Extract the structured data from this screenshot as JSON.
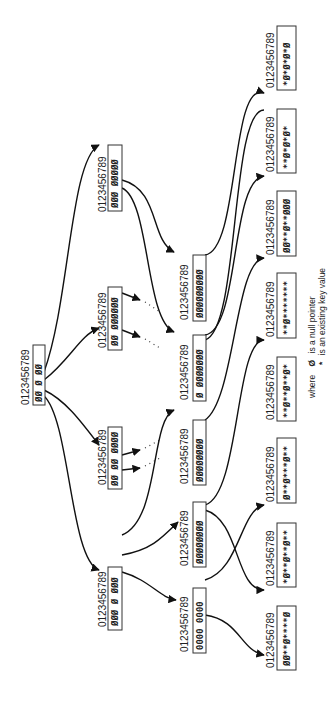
{
  "diagram": {
    "orientation": "rotated -90deg (text reads bottom-to-top)",
    "index_label": "0123456789",
    "root": {
      "label": "0123456789",
      "contents": "ØØ Ø ØØ"
    },
    "level1": [
      {
        "label": "0123456789",
        "contents": "ØØØ ØØØØØ"
      },
      {
        "label": "0123456789",
        "contents": "ØØ ØØØØØØ"
      },
      {
        "label": "0123456789",
        "contents": "ØØ ØØ ØØØØ"
      },
      {
        "label": "0123456789",
        "contents": "ØØØ Ø ØØØ"
      }
    ],
    "level2": [
      {
        "label": "0123456789",
        "contents": "ØØØØØØØØØ"
      },
      {
        "label": "0123456789",
        "contents": "Ø ØØØØØØØ"
      },
      {
        "label": "0123456789",
        "contents": "ØØØØØØØØ"
      },
      {
        "label": "0123456789",
        "contents": "ØØØØØØØØ"
      },
      {
        "label": "0123456789",
        "contents": "0000 0000"
      }
    ],
    "leaves": [
      {
        "label": "0123456789",
        "contents": "*Ø*Ø*Ø*Ø"
      },
      {
        "label": "0123456789",
        "contents": "**Ø*Ø*Ø*"
      },
      {
        "label": "0123456789",
        "contents": "ØØ**Ø**ØØØ"
      },
      {
        "label": "0123456789",
        "contents": "**Ø*******"
      },
      {
        "label": "0123456789",
        "contents": "**Ø**Ø**Ø*"
      },
      {
        "label": "0123456789",
        "contents": "Ø**Ø***Ø**"
      },
      {
        "label": "0123456789",
        "contents": "*Ø**Ø**Ø**"
      },
      {
        "label": "0123456789",
        "contents": "ØØ**Ø****Ø"
      }
    ],
    "legend": {
      "line1_prefix": "where",
      "line1_symbol": "Ø",
      "line1_text": "is a null pointer",
      "line2_symbol": "*",
      "line2_text": "is an existing key value"
    }
  }
}
